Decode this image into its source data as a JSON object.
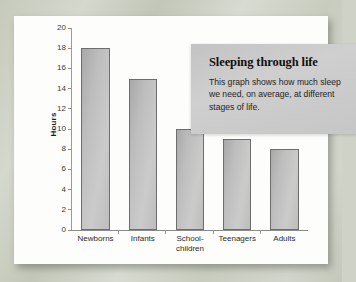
{
  "callout": {
    "title": "Sleeping through life",
    "body": "This graph shows how much sleep we need, on average, at different stages of life."
  },
  "chart_data": {
    "type": "bar",
    "title": "Sleeping through life",
    "subtitle": "This graph shows how much sleep we need, on average, at different stages of life.",
    "categories": [
      "Newborns",
      "Infants",
      "School-children",
      "Teenagers",
      "Adults"
    ],
    "category_lines": [
      [
        "Newborns"
      ],
      [
        "Infants"
      ],
      [
        "School-",
        "children"
      ],
      [
        "Teenagers"
      ],
      [
        "Adults"
      ]
    ],
    "values": [
      18,
      15,
      10,
      9,
      8
    ],
    "xlabel": "",
    "ylabel": "Hours",
    "ylim": [
      0,
      20
    ],
    "yticks": [
      0,
      2,
      4,
      6,
      8,
      10,
      12,
      14,
      16,
      18,
      20
    ],
    "ytick_labels": [
      "0",
      "2",
      "4",
      "6",
      "8",
      "10",
      "12",
      "14",
      "16",
      "18",
      "20"
    ],
    "grid": false,
    "legend": null,
    "units": "hours per day"
  },
  "colors": {
    "bar_fill": "#bdbdbd",
    "bar_border": "#6d6d6d",
    "page": "#fdfdfb",
    "callout_bg": "#c8c8c8",
    "backdrop": "#cfd2c6",
    "axis": "#9a9a9a",
    "text": "#1c1c1c"
  }
}
